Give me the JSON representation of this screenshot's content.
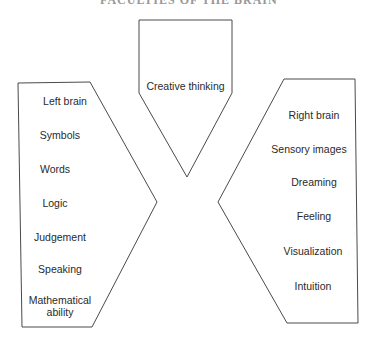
{
  "title_fragment": "FACULTIES OF THE BRAIN",
  "diagram": {
    "top_shape": {
      "label": "Creative thinking"
    },
    "left_shape": {
      "items": [
        "Left brain",
        "Symbols",
        "Words",
        "Logic",
        "Judgement",
        "Speaking",
        "Mathematical ability"
      ]
    },
    "right_shape": {
      "items": [
        "Right brain",
        "Sensory images",
        "Dreaming",
        "Feeling",
        "Visualization",
        "Intuition"
      ]
    },
    "stroke_color": "#4a4a4a",
    "background_color": "#ffffff"
  }
}
